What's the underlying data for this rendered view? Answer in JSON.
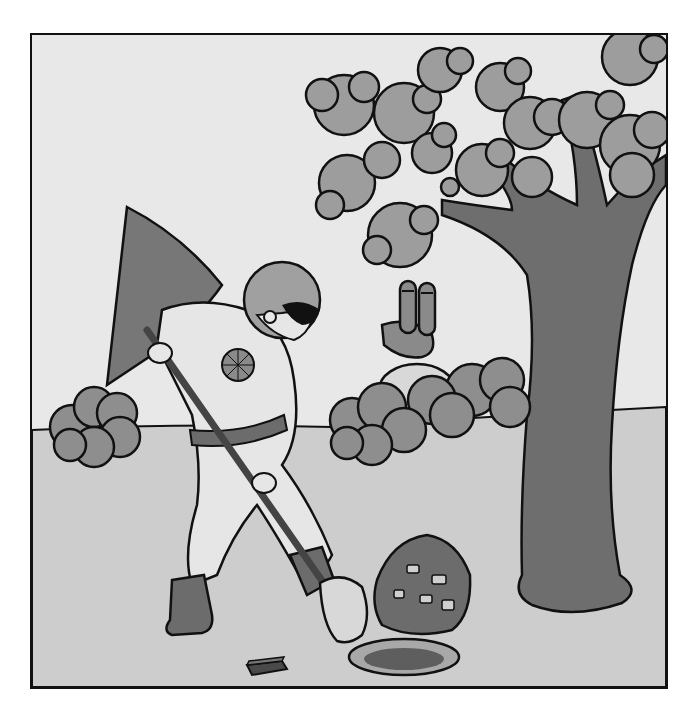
{
  "illustration": {
    "description": "Pencil-shaded grayscale drawing: a masked, caped hero in a helmet digs a hole with a shovel next to a pile of rocks; a two-eyed periscope-like creature peeks from behind bushes; a large leafy tree stands on the right; a small brick lies in the grass.",
    "elements": [
      "caped-hero-with-shovel",
      "tree",
      "periscope-creature",
      "bushes",
      "rock-pile",
      "hole",
      "brick"
    ],
    "palette": {
      "sky": "#e6e6e6",
      "ground": "#cfcfcf",
      "foliage": "#9a9a9a",
      "trunk": "#6e6e6e",
      "cape": "#777777",
      "outline": "#111111"
    }
  },
  "caption": {
    "text": "",
    "note": "caption line cut off at bottom edge; only tops of glyphs visible"
  }
}
